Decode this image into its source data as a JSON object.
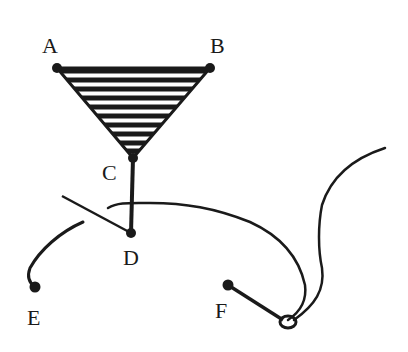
{
  "diagram": {
    "type": "hand-drawn mechanism / string diagram",
    "points": [
      {
        "id": "A",
        "label": "A",
        "x": 57,
        "y": 68
      },
      {
        "id": "B",
        "label": "B",
        "x": 210,
        "y": 68
      },
      {
        "id": "C",
        "label": "C",
        "x": 133,
        "y": 158
      },
      {
        "id": "D",
        "label": "D",
        "x": 131,
        "y": 233
      },
      {
        "id": "E",
        "label": "E",
        "x": 35,
        "y": 287
      },
      {
        "id": "F",
        "label": "F",
        "x": 228,
        "y": 285
      }
    ],
    "shapes": {
      "triangle": {
        "vertices": [
          "A",
          "B",
          "C"
        ],
        "fill": "horizontal-hatch"
      },
      "rod": {
        "from": "C",
        "to": "D"
      },
      "loop": {
        "x": 288,
        "y": 322
      }
    },
    "colors": {
      "ink": "#1a1a1a",
      "background": "#ffffff"
    }
  }
}
